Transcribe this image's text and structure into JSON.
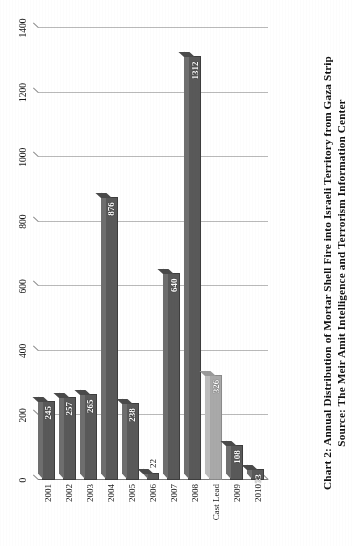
{
  "caption": {
    "line1": "Chart 2: Annual Distribution of Mortar Shell Fire into Israeli Territory from Gaza Strip",
    "line2": "Source: The Meir Amit Intelligence and Terrorism Information Center"
  },
  "colors": {
    "bar_default": "#595959",
    "bar_highlight": "#a9a9a9",
    "gridline": "#b9b9b9",
    "axis": "#7a7a7a",
    "text": "#1a1a1a",
    "background": "#ffffff"
  },
  "chart_data": {
    "type": "bar",
    "orientation": "horizontal",
    "title": "Chart 2: Annual Distribution of Mortar Shell Fire into Israeli Territory from Gaza Strip",
    "subtitle": "Source: The Meir Amit Intelligence and Terrorism Information Center",
    "xlabel": "",
    "ylabel": "",
    "categories": [
      "2001",
      "2002",
      "2003",
      "2004",
      "2005",
      "2006",
      "2007",
      "2008",
      "Cast Lead",
      "2009",
      "2010"
    ],
    "values": [
      245,
      257,
      265,
      876,
      238,
      22,
      640,
      1312,
      326,
      108,
      33
    ],
    "highlight_category": "Cast Lead",
    "value_labels": [
      "245",
      "257",
      "265",
      "876",
      "238",
      "22",
      "640",
      "1312",
      "326",
      "108",
      "33"
    ],
    "label_position": [
      "inside",
      "inside",
      "inside",
      "inside",
      "inside",
      "outside",
      "inside",
      "inside",
      "inside",
      "inside",
      "inside"
    ],
    "xlim": [
      0,
      1400
    ],
    "ticks": [
      0,
      200,
      400,
      600,
      800,
      1000,
      1200,
      1400
    ],
    "tick_labels": [
      "0",
      "200",
      "400",
      "600",
      "800",
      "1000",
      "1200",
      "1400"
    ],
    "grid": true,
    "legend": false,
    "style": "3d-scanned"
  }
}
